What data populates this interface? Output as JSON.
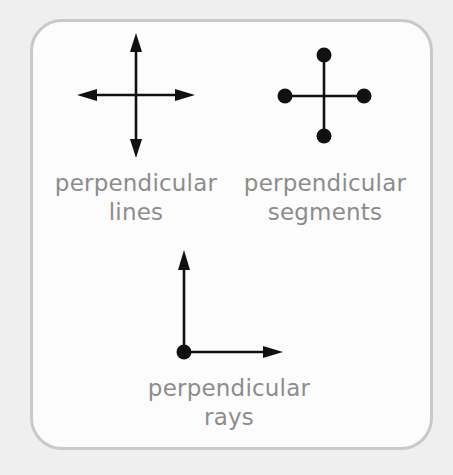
{
  "diagram": {
    "colors": {
      "background": "#efefef",
      "card": "#fcfcfc",
      "border": "#c9c9c9",
      "stroke": "#111111",
      "label": "#8c8c8c"
    },
    "figures": [
      {
        "id": "lines",
        "type": "perpendicular-lines",
        "caption_line1": "perpendicular",
        "caption_line2": "lines",
        "description": "Two lines crossing at a right angle, arrowheads on all four ends"
      },
      {
        "id": "segments",
        "type": "perpendicular-segments",
        "caption_line1": "perpendicular",
        "caption_line2": "segments",
        "description": "Two segments crossing at a right angle, dot endpoints on all four ends"
      },
      {
        "id": "rays",
        "type": "perpendicular-rays",
        "caption_line1": "perpendicular",
        "caption_line2": "rays",
        "description": "Two rays sharing a common endpoint dot, one pointing up, one pointing right"
      }
    ]
  }
}
